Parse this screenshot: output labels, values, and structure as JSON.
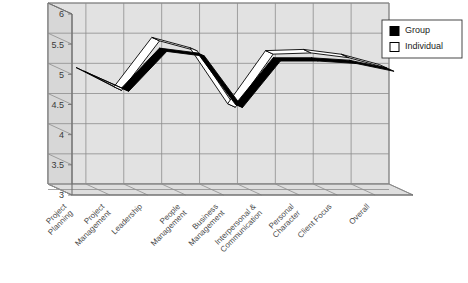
{
  "chart_data": {
    "type": "line",
    "title": "",
    "subtitle": "",
    "xlabel": "",
    "ylabel": "",
    "ylim": [
      3,
      6
    ],
    "yticks": [
      "3",
      "3.5",
      "4",
      "4.5",
      "5",
      "5.5",
      "6"
    ],
    "ytick_values": [
      3,
      3.5,
      4,
      4.5,
      5,
      5.5,
      6
    ],
    "grid": true,
    "three_d": true,
    "legend_position": "top-right",
    "categories": [
      "Project\nPlanning",
      "Project\nManagement",
      "Leadership",
      "People\nManagement",
      "Business\nManagement",
      "Interpersonal &\nCommunication",
      "Personal\nCharacter",
      "Client Focus",
      "Overall"
    ],
    "series": [
      {
        "name": "Group",
        "color": "#000000",
        "values": [
          5.0,
          4.72,
          5.38,
          5.3,
          4.45,
          5.22,
          5.22,
          5.18,
          5.05
        ]
      },
      {
        "name": "Individual",
        "color": "#ffffff",
        "values": [
          5.0,
          4.68,
          5.5,
          5.33,
          4.4,
          5.28,
          5.3,
          5.22,
          5.05
        ]
      }
    ]
  },
  "legend": {
    "entries": [
      {
        "label": "Group",
        "swatch": "filled"
      },
      {
        "label": "Individual",
        "swatch": "hollow"
      }
    ]
  },
  "colors": {
    "wall_back": "#e2e2e2",
    "wall_side": "#d7d7d7",
    "floor": "#dedede",
    "gridline": "#8d8d8d",
    "axis": "#6f6f6f",
    "group": "#000000",
    "individual": "#ffffff",
    "outline": "#000000",
    "background": "#ffffff",
    "text": "#3a3a3a"
  }
}
